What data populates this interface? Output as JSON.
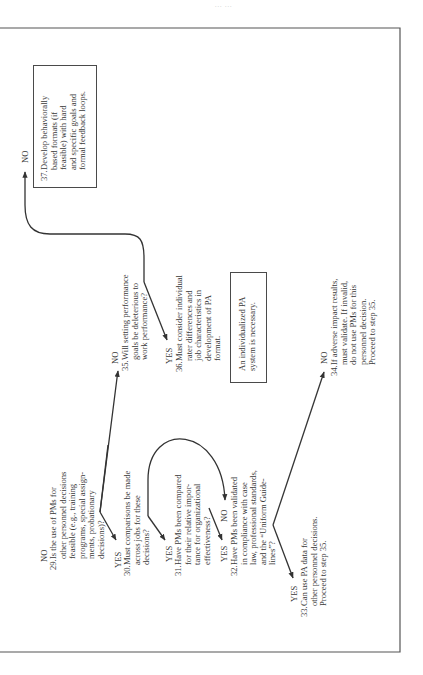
{
  "page": {
    "header_fragment": "...  ...",
    "orientation": "rotated-90-ccw",
    "border_color": "#4a4a4a",
    "text_color": "#3a3a3a"
  },
  "flowchart": {
    "steps": {
      "s29": {
        "branch_label": "NO",
        "number": "29.",
        "lines": [
          "Is the use of PMs for",
          "other personnel decisions",
          "feasible (e.g., training",
          "programs, special assign-",
          "ments, probationary",
          "decisions)?"
        ]
      },
      "s30": {
        "branch_label": "YES",
        "number": "30.",
        "lines": [
          "Must comparisons be made",
          "across jobs for these",
          "decisions?"
        ]
      },
      "s31": {
        "branch_label": "YES",
        "number": "31.",
        "lines": [
          "Have PMs been compared",
          "for their relative impor-",
          "tance for organizational",
          "effectiveness?"
        ]
      },
      "s32": {
        "branch_label_yes": "YES",
        "branch_label_no": "NO",
        "number": "32.",
        "lines": [
          "Have PMs been validated",
          "in compliance with case",
          "law, professional standards,",
          "and the “Uniform Guide-",
          "lines”?"
        ]
      },
      "s33": {
        "branch_label": "YES",
        "number": "33.",
        "lines": [
          "Can use PA data for",
          "other personnel decisions.",
          "Proceed to step 35."
        ]
      },
      "s34": {
        "branch_label": "NO",
        "number": "34.",
        "lines": [
          "If adverse impact results,",
          "must validate. If invalid,",
          "do not use PMs for this",
          "personnel decision.",
          "Proceed to step 35."
        ]
      },
      "s35": {
        "branch_label": "NO",
        "number": "35.",
        "lines": [
          "Will setting performance",
          "goals be deleterious to",
          "work performance?"
        ]
      },
      "s36": {
        "branch_label": "YES",
        "number": "36.",
        "lines": [
          "Must consider individual",
          "rater differences and",
          "job characteristics in",
          "development of PA",
          "format."
        ]
      },
      "s37": {
        "branch_label": "NO",
        "number": "37.",
        "lines": [
          "Develop behaviorally",
          "based formats (if",
          "feasible) with hard",
          "and specific goals and",
          "formal feedback loops."
        ]
      }
    },
    "note_box": {
      "lines": [
        "An individualized PA",
        "system is necessary."
      ]
    }
  }
}
